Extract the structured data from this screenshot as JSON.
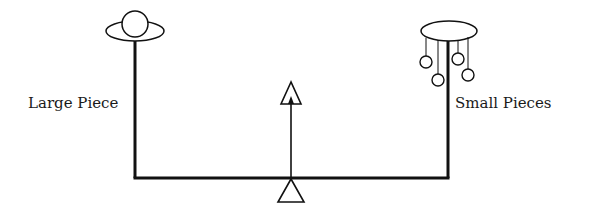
{
  "diagram": {
    "type": "balance-beam",
    "left": {
      "label": "Large Piece",
      "object": "single-large-sphere-on-pan"
    },
    "right": {
      "label": "Small Pieces",
      "object": "four-small-spheres-hanging-from-pan",
      "count": 4
    },
    "fulcrum": {
      "shape": "triangle",
      "position": "center-bottom"
    },
    "indicator": {
      "shape": "upward-arrow-with-triangle-head",
      "position": "center"
    },
    "colors": {
      "stroke": "#111111",
      "background": "#ffffff"
    }
  }
}
